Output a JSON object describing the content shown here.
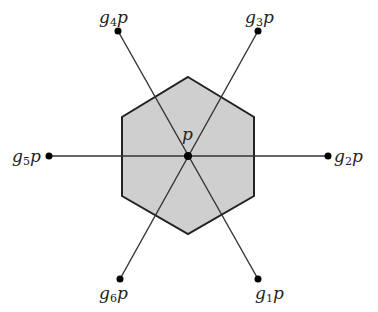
{
  "diagram": {
    "center": {
      "label": "p",
      "x": 188,
      "y": 156
    },
    "hexagon": {
      "fill": "#cfcfcf",
      "stroke": "#222222",
      "vertices": [
        [
          188,
          77
        ],
        [
          254,
          117
        ],
        [
          254,
          196
        ],
        [
          188,
          234
        ],
        [
          122,
          196
        ],
        [
          122,
          117
        ]
      ]
    },
    "points": [
      {
        "name": "g1p",
        "base": "g",
        "sub": "1",
        "tail": "p",
        "x": 258,
        "y": 279,
        "lx": 255,
        "ly": 285
      },
      {
        "name": "g2p",
        "base": "g",
        "sub": "2",
        "tail": "p",
        "x": 328,
        "y": 156,
        "lx": 334,
        "ly": 148
      },
      {
        "name": "g3p",
        "base": "g",
        "sub": "3",
        "tail": "p",
        "x": 258,
        "y": 31,
        "lx": 245,
        "ly": 9
      },
      {
        "name": "g4p",
        "base": "g",
        "sub": "4",
        "tail": "p",
        "x": 118,
        "y": 31,
        "lx": 99,
        "ly": 9
      },
      {
        "name": "g5p",
        "base": "g",
        "sub": "5",
        "tail": "p",
        "x": 49,
        "y": 156,
        "lx": 12,
        "ly": 148
      },
      {
        "name": "g6p",
        "base": "g",
        "sub": "6",
        "tail": "p",
        "x": 120,
        "y": 279,
        "lx": 99,
        "ly": 285
      }
    ]
  }
}
